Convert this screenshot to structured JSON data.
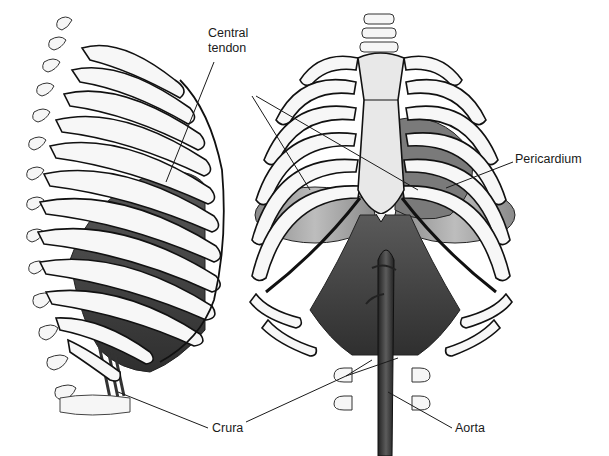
{
  "figure": {
    "views": [
      {
        "name": "lateral-view",
        "orientation": "left side view of rib cage"
      },
      {
        "name": "anterior-view",
        "orientation": "front view of rib cage"
      }
    ],
    "colors": {
      "background": "#ffffff",
      "bone_fill": "#f4f4f4",
      "bone_outline": "#111111",
      "muscle_dark": "#3a3a3a",
      "muscle_mid": "#6a6a6a",
      "aorta": "#2e2e2e",
      "leader_line": "#1a1a1a"
    }
  },
  "labels": {
    "central_tendon": {
      "line1": "Central",
      "line2": "tendon"
    },
    "pericardium": "Pericardium",
    "crura": "Crura",
    "aorta": "Aorta"
  }
}
